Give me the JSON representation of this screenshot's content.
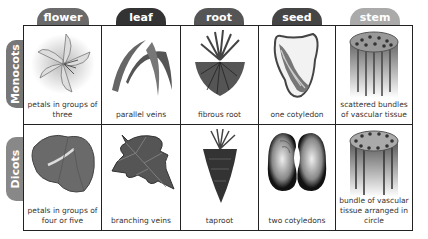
{
  "columns": [
    {
      "label": "flower",
      "color": "#6a6a6a"
    },
    {
      "label": "leaf",
      "color": "#333333"
    },
    {
      "label": "root",
      "color": "#555555"
    },
    {
      "label": "seed",
      "color": "#454545"
    },
    {
      "label": "stem",
      "color": "#aaaaaa"
    }
  ],
  "rows": [
    {
      "label": "Monocots",
      "color": "#777777",
      "cells": [
        "petals in groups of three",
        "parallel veins",
        "fibrous root",
        "one cotyledon",
        "scattered bundles of vascular tissue"
      ]
    },
    {
      "label": "Dicots",
      "color": "#888888",
      "cells": [
        "petals in groups of four or five",
        "branching veins",
        "taproot",
        "two cotyledons",
        "bundle of vascular tissue arranged in circle"
      ]
    }
  ]
}
